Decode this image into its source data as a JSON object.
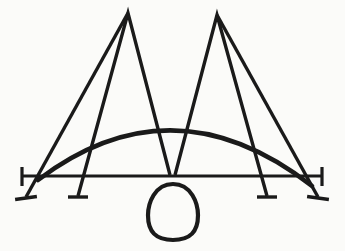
{
  "image": {
    "title": "Abstract line drawing",
    "kind": "monochrome ink sketch",
    "width": 345,
    "height": 251,
    "background_color": "#fbfbf9",
    "ink_color": "#1a1a1a",
    "description": "A double-peaked M-like figure crossed by a shallow dome arc and a horizontal baseline, with four downward strokes ending in foot serifs and an egg-shaped oval hanging below the center"
  },
  "shapes": {
    "baseline": {
      "name": "horizontal baseline",
      "x1": 22,
      "y1": 176,
      "x2": 322,
      "y2": 176,
      "stroke_width": 3.2,
      "left_cap": {
        "x": 22,
        "y_top": 167,
        "y_bottom": 186,
        "stroke_width": 3.2
      },
      "right_cap": {
        "x": 322,
        "y_top": 167,
        "y_bottom": 186,
        "stroke_width": 3.2
      }
    },
    "arc": {
      "name": "shallow dome arc",
      "start": {
        "x": 38,
        "y": 180
      },
      "control": {
        "x": 173,
        "y": 78
      },
      "end": {
        "x": 312,
        "y": 186
      },
      "apex": {
        "x": 175,
        "y": 124
      },
      "stroke_width": 4.6
    },
    "peak_left": {
      "name": "left triangular peak",
      "apex": {
        "x": 128,
        "y": 13
      },
      "left_foot": {
        "x": 78,
        "y": 196
      },
      "right_foot": {
        "x": 170,
        "y": 175
      },
      "stroke_width": 3.4
    },
    "peak_right": {
      "name": "right triangular peak",
      "apex": {
        "x": 217,
        "y": 15
      },
      "left_foot": {
        "x": 175,
        "y": 175
      },
      "right_foot": {
        "x": 267,
        "y": 196
      },
      "stroke_width": 3.4
    },
    "diagonal_left": {
      "name": "left long diagonal stroke",
      "x1": 128,
      "y1": 13,
      "x2": 26,
      "y2": 197,
      "stroke_width": 3.4
    },
    "diagonal_right": {
      "name": "right long diagonal stroke",
      "x1": 217,
      "y1": 15,
      "x2": 318,
      "y2": 197,
      "stroke_width": 3.4
    },
    "oval": {
      "name": "egg shaped oval",
      "center_x": 173,
      "center_y": 212,
      "radius_x": 25,
      "radius_y": 28,
      "stroke_width": 4.2
    },
    "feet": [
      {
        "name": "foot-serif-1",
        "cx": 26,
        "cy": 198,
        "half_width": 11,
        "angle": -8,
        "stroke_width": 3.4
      },
      {
        "name": "foot-serif-2",
        "cx": 78,
        "cy": 197,
        "half_width": 10,
        "angle": 0,
        "stroke_width": 3.4
      },
      {
        "name": "foot-serif-3",
        "cx": 267,
        "cy": 197,
        "half_width": 10,
        "angle": 0,
        "stroke_width": 3.4
      },
      {
        "name": "foot-serif-4",
        "cx": 318,
        "cy": 198,
        "half_width": 11,
        "angle": 8,
        "stroke_width": 3.4
      }
    ]
  }
}
